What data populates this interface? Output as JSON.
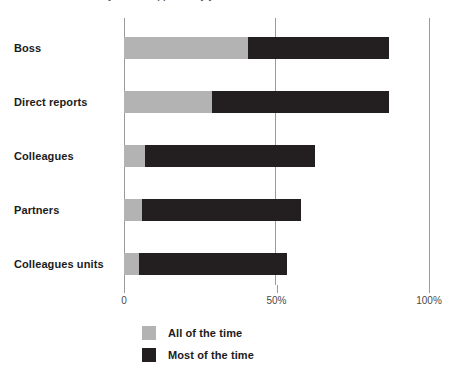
{
  "title_partial": "to what extent do you feel supported by your ...",
  "chart_data": {
    "type": "bar",
    "orientation": "horizontal",
    "stacked": true,
    "title": "",
    "xlabel": "",
    "ylabel": "",
    "xlim": [
      0,
      100
    ],
    "grid": true,
    "gridlines": [
      0,
      50,
      100
    ],
    "legend_position": "bottom-left",
    "categories": [
      "Boss",
      "Direct reports",
      "Colleagues",
      "Partners",
      "Colleagues units"
    ],
    "tick_labels": [
      "0",
      "50%",
      "100%"
    ],
    "tick_values": [
      0,
      50,
      100
    ],
    "series": [
      {
        "name": "All of the time",
        "color": "#b3b3b3",
        "values": [
          40.5,
          29,
          7,
          6,
          5
        ]
      },
      {
        "name": "Most of the time",
        "color": "#231f20",
        "values": [
          46.5,
          58,
          55.5,
          52,
          48.5
        ]
      }
    ],
    "totals": [
      87,
      87,
      62.5,
      58,
      53.5
    ]
  }
}
